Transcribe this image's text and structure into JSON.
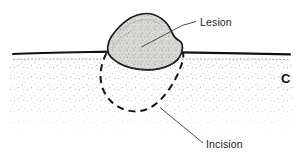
{
  "figure": {
    "panel_letter": "C",
    "type": "medical-cross-section-illustration",
    "background_color": "#ffffff",
    "width": 304,
    "height": 162
  },
  "labels": {
    "lesion": "Lesion",
    "incision": "Incision"
  },
  "colors": {
    "skin_surface_line": "#111111",
    "lesion_fill": "#d9d9d6",
    "lesion_outline": "#1a1a1a",
    "dermis_stipple": "#9a9a9a",
    "incision_dash": "#141414",
    "leader_line": "#3b3b3b",
    "label_text": "#1a1a1a",
    "panel_letter": "#111111"
  },
  "anatomy": {
    "skin_surface_label": "skin surface",
    "dermis_label": "dermis (stippled)",
    "lesion_label": "raised pigmented lesion",
    "incision_label": "elliptical excision margin"
  }
}
